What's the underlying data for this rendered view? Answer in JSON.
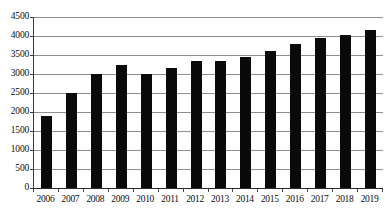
{
  "chart_data": {
    "type": "bar",
    "title": "",
    "title_note": "title row is cropped off the top edge of the screenshot and is not legible",
    "xlabel": "",
    "ylabel": "",
    "categories": [
      "2006",
      "2007",
      "2008",
      "2009",
      "2010",
      "2011",
      "2012",
      "2013",
      "2014",
      "2015",
      "2016",
      "2017",
      "2018",
      "2019"
    ],
    "values": [
      1900,
      2500,
      3000,
      3250,
      3000,
      3150,
      3350,
      3350,
      3450,
      3600,
      3780,
      3960,
      4030,
      4160
    ],
    "ylim": [
      0,
      4500
    ],
    "ytick_labels": [
      "0",
      "500",
      "1000",
      "1500",
      "2000",
      "2500",
      "3000",
      "3500",
      "4000",
      "4500"
    ],
    "ytick_values": [
      0,
      500,
      1000,
      1500,
      2000,
      2500,
      3000,
      3500,
      4000,
      4500
    ],
    "grid": true,
    "grid_axis": "y",
    "legend": false,
    "legend_position": "none",
    "bar_color": "#0a0a0a",
    "gridline_color": "#8e8e8e",
    "axis_color": "#2a2a2a",
    "background_color": "#ffffff"
  }
}
